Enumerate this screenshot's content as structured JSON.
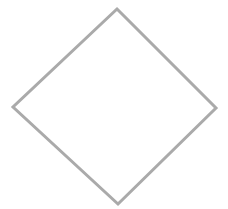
{
  "canvas": {
    "width": 228,
    "height": 209,
    "background_color": "#FFFFFF"
  },
  "figure": {
    "name": "diamond-outline",
    "kind": "diagram",
    "shape_type": "rhombus",
    "fill": "none",
    "fill_color": "#FFFFFF",
    "stroke_color": "#AAAAAA",
    "stroke_width": 3,
    "edge_softness": "antialiased",
    "vertex_count": 4,
    "closed": true,
    "vertices": [
      {
        "label": "top",
        "x": 117,
        "y": 9
      },
      {
        "label": "right",
        "x": 216,
        "y": 108
      },
      {
        "label": "bottom",
        "x": 118,
        "y": 204
      },
      {
        "label": "left",
        "x": 13,
        "y": 107
      }
    ],
    "points_attr": "117,9 216,108 118,204 13,107",
    "center": {
      "x": 116,
      "y": 106
    },
    "bounding_box": {
      "x": 13,
      "y": 9,
      "width": 203,
      "height": 195
    },
    "interior_content": "",
    "labels": []
  }
}
